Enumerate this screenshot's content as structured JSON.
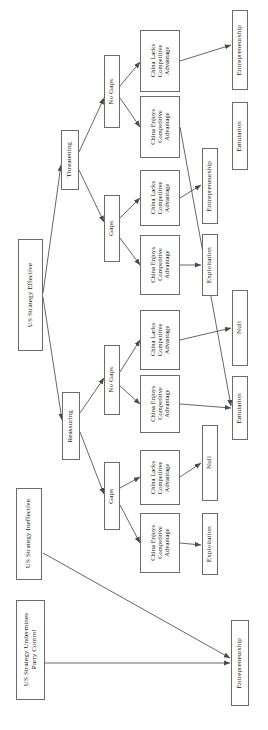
{
  "figure": {
    "type": "decision-tree",
    "orientation": "rotated-90-ccw",
    "background": "#ffffff",
    "line_color": "#4a4a4a",
    "box_border_color": "#6b6b6b",
    "text_color": "#1a1a1a"
  },
  "nodes": {
    "root_effective": {
      "label": "US Strategy Effective"
    },
    "root_ineffective": {
      "label": "US Strategy Ineffective"
    },
    "root_undermines": {
      "label": "US Strategy Undermines\nParty Control"
    },
    "stance_threatening": {
      "label": "Threatening"
    },
    "stance_reassuring": {
      "label": "Reassuring"
    },
    "gap_t_nogaps": {
      "label": "No Gaps"
    },
    "gap_t_gaps": {
      "label": "Gaps"
    },
    "gap_r_nogaps": {
      "label": "No Gaps"
    },
    "gap_r_gaps": {
      "label": "Gaps"
    },
    "china_1": {
      "label": "China Lacks\nCompetitive\nAdvantage"
    },
    "china_2": {
      "label": "China Enjoys\nCompetitive\nAdvantage"
    },
    "china_3": {
      "label": "China Lacks\nCompetitive\nAdvantage"
    },
    "china_4": {
      "label": "China Enjoys\nCompetitive\nAdvantage"
    },
    "china_5": {
      "label": "China Lacks\nCompetitive\nAdvantage"
    },
    "china_6": {
      "label": "China Enjoys\nCompetitive\nAdvantage"
    },
    "china_7": {
      "label": "China Lacks\nCompetitive\nAdvantage"
    },
    "china_8": {
      "label": "China Enjoys\nCompetitive\nAdvantage"
    },
    "out_1": {
      "label": "Entrepreneurship"
    },
    "out_2": {
      "label": "Emulation"
    },
    "out_3": {
      "label": "Entrepreneurship"
    },
    "out_4": {
      "label": "Exploitation"
    },
    "out_5": {
      "label": "Null"
    },
    "out_6": {
      "label": "Emulation"
    },
    "out_7": {
      "label": "Null"
    },
    "out_8": {
      "label": "Exploitation"
    },
    "out_9": {
      "label": "Entrepreneurship"
    }
  },
  "edges": [
    {
      "from": "root_effective",
      "to": "stance_threatening"
    },
    {
      "from": "root_effective",
      "to": "stance_reassuring"
    },
    {
      "from": "stance_threatening",
      "to": "gap_t_nogaps"
    },
    {
      "from": "stance_threatening",
      "to": "gap_t_gaps"
    },
    {
      "from": "stance_reassuring",
      "to": "gap_r_nogaps"
    },
    {
      "from": "stance_reassuring",
      "to": "gap_r_gaps"
    },
    {
      "from": "gap_t_nogaps",
      "to": "china_1"
    },
    {
      "from": "gap_t_nogaps",
      "to": "china_2"
    },
    {
      "from": "gap_t_gaps",
      "to": "china_3"
    },
    {
      "from": "gap_t_gaps",
      "to": "china_4"
    },
    {
      "from": "gap_r_nogaps",
      "to": "china_5"
    },
    {
      "from": "gap_r_nogaps",
      "to": "china_6"
    },
    {
      "from": "gap_r_gaps",
      "to": "china_7"
    },
    {
      "from": "gap_r_gaps",
      "to": "china_8"
    },
    {
      "from": "china_1",
      "to": "out_1"
    },
    {
      "from": "china_2",
      "to": "out_2"
    },
    {
      "from": "china_3",
      "to": "out_3"
    },
    {
      "from": "china_4",
      "to": "out_4"
    },
    {
      "from": "china_5",
      "to": "out_5"
    },
    {
      "from": "china_6",
      "to": "out_6"
    },
    {
      "from": "china_7",
      "to": "out_7"
    },
    {
      "from": "china_8",
      "to": "out_8"
    },
    {
      "from": "root_ineffective",
      "to": "out_9"
    },
    {
      "from": "root_undermines",
      "to": "out_9"
    }
  ]
}
